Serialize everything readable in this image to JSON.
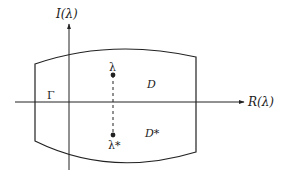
{
  "diagram": {
    "axes": {
      "vertical_label": "I(λ)",
      "horizontal_label": "R(λ)"
    },
    "region": {
      "boundary_label": "Γ",
      "upper_label": "D",
      "lower_label": "D*"
    },
    "points": {
      "upper": "λ",
      "lower": "λ*"
    },
    "colors": {
      "stroke": "#222222",
      "background": "#ffffff"
    }
  }
}
